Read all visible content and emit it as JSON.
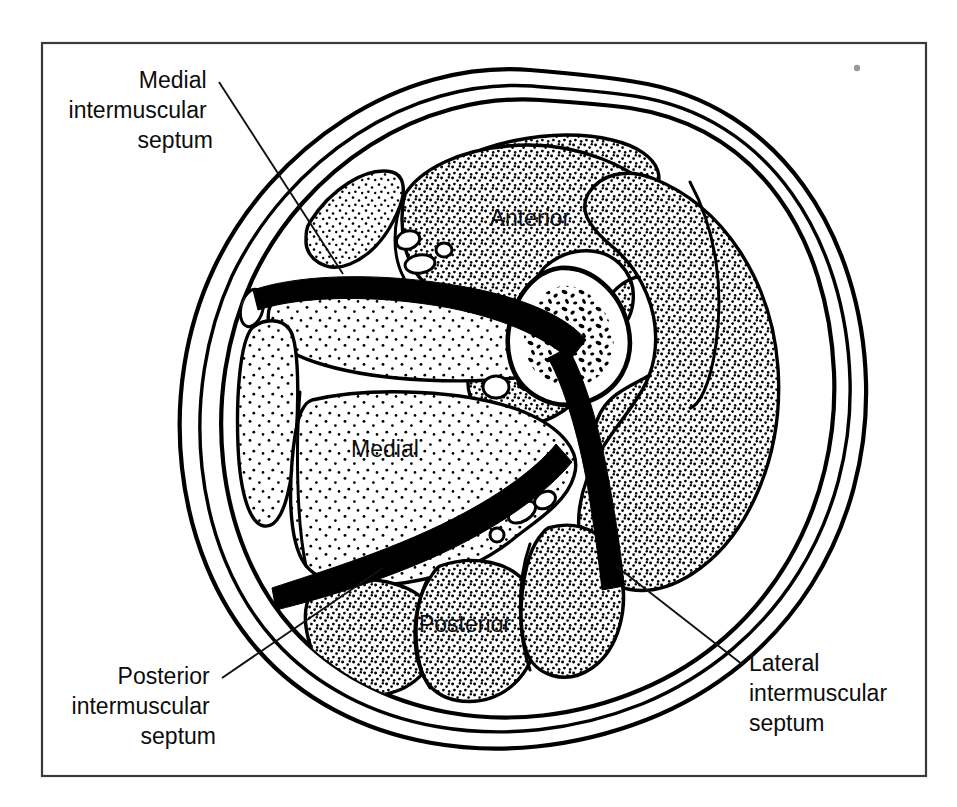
{
  "figure": {
    "background_color": "#ffffff",
    "ink_color": "#000000",
    "frame_color": "#3a3a3a"
  },
  "compartment_labels": [
    {
      "id": "anterior",
      "text": "Anterior",
      "x": 530,
      "y": 226
    },
    {
      "id": "medial",
      "text": "Medial",
      "x": 385,
      "y": 457
    },
    {
      "id": "posterior",
      "text": "Posterior",
      "x": 465,
      "y": 632
    }
  ],
  "callouts": [
    {
      "id": "medial-intermuscular-septum",
      "lines": [
        "Medial",
        "intermuscular",
        "septum"
      ],
      "anchor": "end",
      "text_x": 213,
      "text_y": 88,
      "line_height": 30,
      "leader": "M 219 82 L 343 274"
    },
    {
      "id": "posterior-intermuscular-septum",
      "lines": [
        "Posterior",
        "intermuscular",
        "septum"
      ],
      "anchor": "end",
      "text_x": 216,
      "text_y": 684,
      "line_height": 30,
      "leader": "M 222 678 L 383 568"
    },
    {
      "id": "lateral-intermuscular-septum",
      "lines": [
        "Lateral",
        "intermuscular",
        "septum"
      ],
      "anchor": "start",
      "text_x": 749,
      "text_y": 671,
      "line_height": 30,
      "leader": "M 743 665 L 616 566"
    }
  ],
  "structures": {
    "skin_outline": "skin-outer-boundary",
    "subcutaneous_layer": "subcutaneous-fat-layer",
    "deep_fascia": "deep-fascia-layer",
    "bone": "bone-with-marrow-cavity",
    "neurovascular_bundles": "neurovascular-bundle-vessels",
    "septa": [
      "medial-septum",
      "lateral-septum",
      "posterior-septum"
    ]
  },
  "artifact": {
    "id": "print-speck",
    "x": 857,
    "y": 68,
    "r": 3
  }
}
